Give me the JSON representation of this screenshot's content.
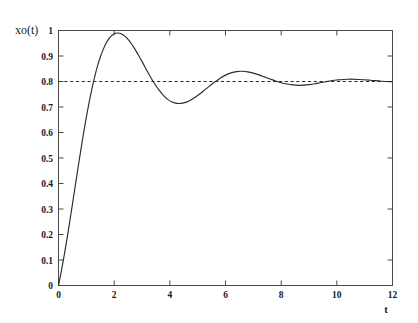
{
  "chart_data": {
    "type": "line",
    "title": "",
    "subtitle": "",
    "xlabel": "t",
    "ylabel": "xo(t)",
    "xlim": [
      0,
      12
    ],
    "ylim": [
      0,
      1
    ],
    "grid": false,
    "legend_position": "none",
    "xticks": [
      0,
      2,
      4,
      6,
      8,
      10,
      12
    ],
    "xtick_labels": [
      "0",
      "2",
      "4",
      "6",
      "8",
      "10",
      "12"
    ],
    "yticks": [
      0,
      0.1,
      0.2,
      0.3,
      0.4,
      0.5,
      0.6,
      0.7,
      0.8,
      0.9,
      1
    ],
    "ytick_labels": [
      "0",
      "0.1",
      "0.2",
      "0.3",
      "0.4",
      "0.5",
      "0.6",
      "0.7",
      "0.8",
      "0.9",
      "1"
    ],
    "xminor_ticks": [
      1,
      3,
      5,
      7,
      9,
      11
    ],
    "series": [
      {
        "name": "xo(t)",
        "style": "solid",
        "color": "#2b2b2b",
        "x": [
          0.0,
          0.1,
          0.2,
          0.3,
          0.4,
          0.5,
          0.6,
          0.7,
          0.8,
          0.9,
          1.0,
          1.1,
          1.2,
          1.3,
          1.4,
          1.5,
          1.6,
          1.7,
          1.8,
          1.9,
          2.0,
          2.1,
          2.2,
          2.3,
          2.4,
          2.5,
          2.6,
          2.7,
          2.8,
          2.9,
          3.0,
          3.2,
          3.4,
          3.6,
          3.8,
          4.0,
          4.2,
          4.4,
          4.6,
          4.8,
          5.0,
          5.2,
          5.4,
          5.6,
          5.8,
          6.0,
          6.2,
          6.4,
          6.6,
          6.8,
          7.0,
          7.2,
          7.4,
          7.6,
          7.8,
          8.0,
          8.2,
          8.4,
          8.6,
          8.8,
          9.0,
          9.2,
          9.4,
          9.6,
          9.8,
          10.0,
          10.4,
          10.8,
          11.2,
          11.6,
          12.0
        ],
        "y": [
          0.0,
          0.055,
          0.115,
          0.18,
          0.248,
          0.318,
          0.39,
          0.46,
          0.53,
          0.597,
          0.66,
          0.718,
          0.771,
          0.818,
          0.86,
          0.895,
          0.924,
          0.948,
          0.966,
          0.979,
          0.987,
          0.99,
          0.989,
          0.984,
          0.976,
          0.965,
          0.951,
          0.935,
          0.917,
          0.898,
          0.879,
          0.838,
          0.8,
          0.768,
          0.742,
          0.724,
          0.715,
          0.714,
          0.719,
          0.73,
          0.745,
          0.762,
          0.78,
          0.797,
          0.812,
          0.825,
          0.834,
          0.839,
          0.84,
          0.838,
          0.833,
          0.826,
          0.818,
          0.81,
          0.802,
          0.795,
          0.79,
          0.787,
          0.785,
          0.786,
          0.788,
          0.791,
          0.795,
          0.799,
          0.803,
          0.806,
          0.809,
          0.808,
          0.805,
          0.801,
          0.799
        ]
      },
      {
        "name": "steady-state reference",
        "style": "dashed",
        "color": "#2b2b2b",
        "value": 0.8,
        "x": [
          0,
          12
        ],
        "y": [
          0.8,
          0.8
        ]
      }
    ],
    "annotations": [
      {
        "text": "steady state = 0.8",
        "value": 0.8
      },
      {
        "text": "overshoot peak",
        "x": 2.1,
        "y": 0.99
      },
      {
        "text": "first undershoot",
        "x": 4.3,
        "y": 0.714
      },
      {
        "text": "second peak",
        "x": 6.6,
        "y": 0.84
      }
    ]
  },
  "axes": {
    "ylabel": "xo(t)",
    "xlabel": "t"
  }
}
